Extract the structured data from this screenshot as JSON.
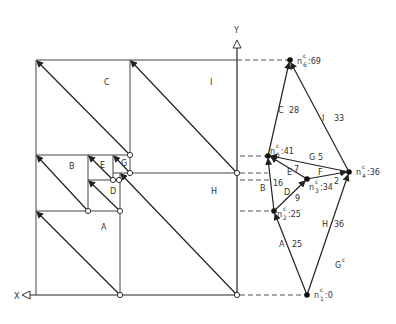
{
  "axes": {
    "x_label": "X",
    "y_label": "Y"
  },
  "regions": {
    "A": "A",
    "B": "B",
    "C": "C",
    "D": "D",
    "E": "E",
    "G": "G",
    "H": "H",
    "I": "I"
  },
  "graph": {
    "name": "G",
    "name_sup": "c",
    "nodes": [
      {
        "id": "n1",
        "base": "n",
        "sup": "c",
        "sub": "1",
        "value": ":0"
      },
      {
        "id": "n2",
        "base": "n",
        "sup": "c",
        "sub": "2",
        "value": ":25"
      },
      {
        "id": "n3",
        "base": "n",
        "sup": "c",
        "sub": "3",
        "value": ":34"
      },
      {
        "id": "n4",
        "base": "n",
        "sup": "c",
        "sub": "4",
        "value": ":36"
      },
      {
        "id": "n5",
        "base": "n",
        "sup": "c",
        "sub": "5",
        "value": ":41"
      },
      {
        "id": "n6",
        "base": "n",
        "sup": "c",
        "sub": "6",
        "value": ":69"
      }
    ],
    "edges": [
      {
        "from": "n1",
        "to": "n2",
        "label": "A",
        "weight": "25"
      },
      {
        "from": "n2",
        "to": "n5",
        "label": "B",
        "weight": "16"
      },
      {
        "from": "n5",
        "to": "n6",
        "label": "C",
        "weight": "28"
      },
      {
        "from": "n2",
        "to": "n3",
        "label": "D",
        "weight": "9"
      },
      {
        "from": "n3",
        "to": "n5",
        "label": "E",
        "weight": "7"
      },
      {
        "from": "n3",
        "to": "n4",
        "label": "F",
        "weight": "2"
      },
      {
        "from": "n4",
        "to": "n5",
        "label": "G",
        "weight": "5"
      },
      {
        "from": "n1",
        "to": "n4",
        "label": "H",
        "weight": "36"
      },
      {
        "from": "n4",
        "to": "n6",
        "label": "I",
        "weight": "33"
      }
    ]
  }
}
